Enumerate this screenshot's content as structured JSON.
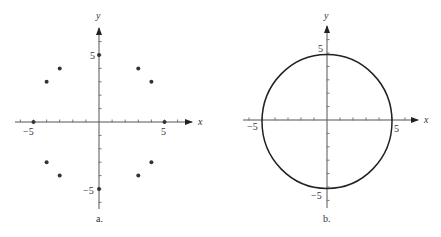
{
  "panels": [
    {
      "id": "a",
      "caption": "a.",
      "x_axis_label": "x",
      "y_axis_label": "y",
      "tick_labels": {
        "x_neg": "−5",
        "x_pos": "5",
        "y_pos": "5",
        "y_neg": "−5"
      },
      "points": [
        [
          0,
          5
        ],
        [
          3,
          4
        ],
        [
          4,
          3
        ],
        [
          5,
          0
        ],
        [
          4,
          -3
        ],
        [
          3,
          -4
        ],
        [
          0,
          -5
        ],
        [
          -3,
          -4
        ],
        [
          -4,
          -3
        ],
        [
          -5,
          0
        ],
        [
          -4,
          3
        ],
        [
          -3,
          4
        ]
      ]
    },
    {
      "id": "b",
      "caption": "b.",
      "x_axis_label": "x",
      "y_axis_label": "y",
      "tick_labels": {
        "x_neg": "−5",
        "x_pos": "5",
        "y_pos": "5",
        "y_neg": "−5"
      },
      "curve": "circle x^2 + y^2 = 25",
      "radius": 5
    }
  ],
  "chart_data": [
    {
      "type": "scatter",
      "title": "a.",
      "xlabel": "x",
      "ylabel": "y",
      "xlim": [
        -7,
        7
      ],
      "ylim": [
        -6.5,
        7
      ],
      "x_ticks": [
        -5,
        5
      ],
      "y_ticks": [
        -5,
        5
      ],
      "grid": false,
      "x": [
        0,
        3,
        4,
        5,
        4,
        3,
        0,
        -3,
        -4,
        -5,
        -4,
        -3
      ],
      "y": [
        5,
        4,
        3,
        0,
        -3,
        -4,
        -5,
        -4,
        -3,
        0,
        3,
        4
      ]
    },
    {
      "type": "line",
      "title": "b.",
      "xlabel": "x",
      "ylabel": "y",
      "xlim": [
        -7,
        7
      ],
      "ylim": [
        -6.5,
        7
      ],
      "x_ticks": [
        -5,
        5
      ],
      "y_ticks": [
        -5,
        5
      ],
      "grid": false,
      "curve": "circle",
      "center": [
        0,
        0
      ],
      "radius": 5
    }
  ]
}
